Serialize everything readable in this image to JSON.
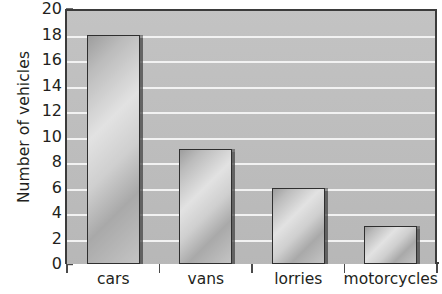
{
  "chart_data": {
    "type": "bar",
    "title": "",
    "categories": [
      "cars",
      "vans",
      "lorries",
      "motorcycles"
    ],
    "values": [
      18,
      9,
      6,
      3
    ],
    "xlabel": "",
    "ylabel": "Number of vehicles",
    "ylim": [
      0,
      20
    ],
    "ytick_step": 2,
    "yticks": [
      0,
      2,
      4,
      6,
      8,
      10,
      12,
      14,
      16,
      18,
      20
    ],
    "ytick_labels": [
      "0",
      "2",
      "4",
      "6",
      "8",
      "10",
      "12",
      "14",
      "16",
      "18",
      "20"
    ],
    "grid": true,
    "grid_orientation": "horizontal",
    "legend": false,
    "legend_position": "none",
    "series": [
      {
        "name": "Number of vehicles",
        "values": [
          18,
          9,
          6,
          3
        ]
      }
    ]
  },
  "axes": {
    "y_title": "Number of vehicles"
  },
  "colors": {
    "plot_background": "#bfbfbf",
    "gridline": "#f2f2f2",
    "axis_line": "#3b3b3b",
    "bar_outline": "#2f2f2f",
    "bar_fill_light": "#e2e2e2",
    "bar_fill_dark": "#9d9d9d",
    "bar_shadow": "#464646",
    "text": "#231f20",
    "page_background": "#ffffff"
  }
}
